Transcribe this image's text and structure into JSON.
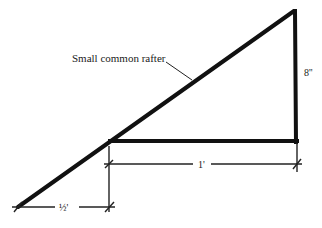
{
  "diagram": {
    "type": "rafter-layout",
    "colors": {
      "stroke": "#111111",
      "background": "#ffffff"
    },
    "labels": {
      "rafter": "Small common rafter",
      "rise": "8''",
      "run": "1'",
      "overhang": "½'"
    },
    "geometry": {
      "apex": [
        294,
        11
      ],
      "right_corner": [
        296,
        141
      ],
      "left_corner": [
        110,
        141
      ],
      "tail_end": [
        18,
        207
      ]
    }
  }
}
